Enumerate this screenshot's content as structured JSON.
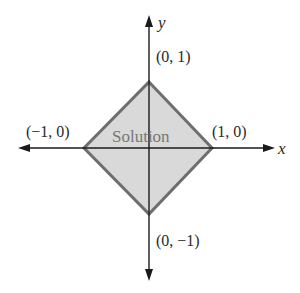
{
  "diagram": {
    "type": "coordinate-plane-region",
    "axes": {
      "x_label": "x",
      "y_label": "y"
    },
    "region": {
      "label": "Solution",
      "fill_color": "#d9d9d9",
      "stroke_color": "#6e6e6e",
      "vertices": [
        {
          "label": "(0, 1)",
          "x": 0,
          "y": 1
        },
        {
          "label": "(1, 0)",
          "x": 1,
          "y": 0
        },
        {
          "label": "(0, −1)",
          "x": 0,
          "y": -1
        },
        {
          "label": "(−1, 0)",
          "x": -1,
          "y": 0
        }
      ]
    },
    "axis_color": "#1a1a1a"
  }
}
